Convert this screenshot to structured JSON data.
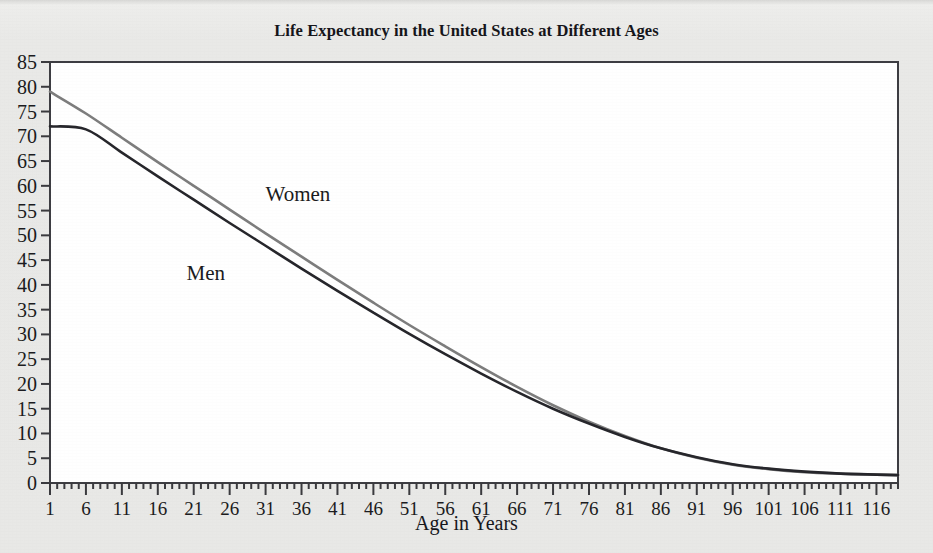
{
  "chart_data": {
    "type": "line",
    "title": "Life Expectancy in the United States at Different Ages",
    "xlabel": "Age in Years",
    "ylabel": "",
    "xlim": [
      1,
      119
    ],
    "ylim": [
      0,
      85
    ],
    "grid": false,
    "legend_position": "inline-annotation",
    "xtick_labels": [
      "1",
      "6",
      "11",
      "16",
      "21",
      "26",
      "31",
      "36",
      "41",
      "46",
      "51",
      "56",
      "61",
      "66",
      "71",
      "76",
      "81",
      "86",
      "91",
      "96",
      "101",
      "106",
      "111",
      "116"
    ],
    "xtick_values": [
      1,
      6,
      11,
      16,
      21,
      26,
      31,
      36,
      41,
      46,
      51,
      56,
      61,
      66,
      71,
      76,
      81,
      86,
      91,
      96,
      101,
      106,
      111,
      116
    ],
    "xtick_minor_step": 1,
    "ytick_labels": [
      "0",
      "5",
      "10",
      "15",
      "20",
      "25",
      "30",
      "35",
      "40",
      "45",
      "50",
      "55",
      "60",
      "65",
      "70",
      "75",
      "80",
      "85"
    ],
    "ytick_values": [
      0,
      5,
      10,
      15,
      20,
      25,
      30,
      35,
      40,
      45,
      50,
      55,
      60,
      65,
      70,
      75,
      80,
      85
    ],
    "x": [
      1,
      6,
      11,
      16,
      21,
      26,
      31,
      36,
      41,
      46,
      51,
      56,
      61,
      66,
      71,
      76,
      81,
      86,
      91,
      96,
      101,
      106,
      111,
      116,
      119
    ],
    "series": [
      {
        "name": "Women",
        "color": "#7d7d7d",
        "label_x": 31,
        "label_y": 57,
        "values": [
          79.0,
          74.6,
          69.7,
          64.8,
          60.0,
          55.2,
          50.4,
          45.7,
          41.0,
          36.4,
          31.9,
          27.6,
          23.4,
          19.4,
          15.7,
          12.4,
          9.5,
          7.0,
          5.1,
          3.7,
          2.8,
          2.2,
          1.9,
          1.7,
          1.6
        ]
      },
      {
        "name": "Men",
        "color": "#26262b",
        "label_x": 20,
        "label_y": 41,
        "values": [
          72.0,
          71.4,
          66.7,
          61.9,
          57.2,
          52.5,
          47.9,
          43.3,
          38.8,
          34.4,
          30.1,
          26.0,
          22.1,
          18.4,
          15.0,
          12.0,
          9.3,
          7.0,
          5.2,
          3.8,
          2.9,
          2.3,
          1.9,
          1.7,
          1.6
        ]
      }
    ]
  },
  "colors": {
    "background": "#e8e8e6",
    "plot_background": "#ffffff",
    "axis": "#3a3a3e",
    "text": "#1b1b20"
  }
}
